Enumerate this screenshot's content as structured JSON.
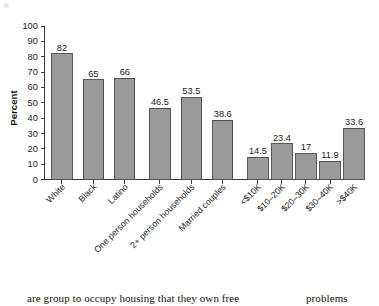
{
  "chart_data": {
    "type": "bar",
    "title": "",
    "xlabel": "",
    "ylabel": "Percent",
    "ylim": [
      0,
      100
    ],
    "yticks": [
      0,
      10,
      20,
      30,
      40,
      50,
      60,
      70,
      80,
      90,
      100
    ],
    "ytick_labels": [
      "0",
      "10",
      "20",
      "30",
      "40",
      "50",
      "60",
      "70",
      "80",
      "90",
      "100"
    ],
    "grid": false,
    "legend": "none",
    "bar_color": "#9a9a9a",
    "bar_edge_color": "#4a4a4a",
    "categories": [
      "White",
      "Black",
      "Latino",
      "One person households",
      "2+ person households",
      "Married couples",
      "<$10K",
      "$10–20K",
      "$20–30K",
      "$30–40K",
      ">$40K"
    ],
    "values": [
      82,
      65,
      66,
      46.5,
      53.5,
      38.6,
      14.5,
      23.4,
      17,
      11.9,
      33.6
    ],
    "value_labels": [
      "82",
      "65",
      "66",
      "46.5",
      "53.5",
      "38.6",
      "14.5",
      "23.4",
      "17",
      "11.9",
      "33.6"
    ],
    "groups": [
      {
        "name": "race-ethnicity",
        "indices": [
          0,
          1,
          2
        ]
      },
      {
        "name": "household-type",
        "indices": [
          3,
          4,
          5
        ]
      },
      {
        "name": "income-bracket",
        "indices": [
          6,
          7,
          8,
          9,
          10
        ]
      }
    ]
  },
  "body_text": {
    "left_fragment": "are group to occupy housing that they own free",
    "right_fragment": "problems"
  }
}
